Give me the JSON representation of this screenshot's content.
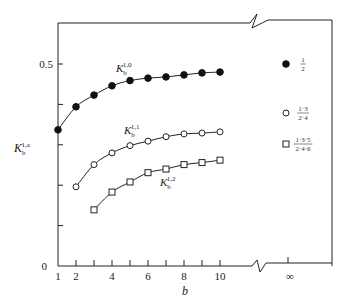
{
  "chart_data": {
    "type": "line",
    "title": "",
    "xlabel": "b",
    "ylabel": "K_b^{1,a}",
    "x": [
      1,
      2,
      3,
      4,
      5,
      6,
      7,
      8,
      9,
      10
    ],
    "x_ticks": [
      1,
      2,
      3,
      4,
      5,
      6,
      7,
      8,
      9,
      10
    ],
    "x_tick_labels": [
      "1",
      "2",
      "4",
      "6",
      "8",
      "10",
      "∞"
    ],
    "y_ticks": [
      0,
      0.1,
      0.2,
      0.3,
      0.4,
      0.5
    ],
    "y_tick_labels": [
      "0",
      "0.5"
    ],
    "ylim": [
      0,
      0.6
    ],
    "x_axis_break": true,
    "grid": false,
    "series": [
      {
        "name": "K_b^{1,0}",
        "label_main": "K",
        "label_sub": "b",
        "label_sup": "1,0",
        "marker": "filled-circle",
        "x": [
          1,
          2,
          3,
          4,
          5,
          6,
          7,
          8,
          9,
          10
        ],
        "values": [
          0.337,
          0.394,
          0.423,
          0.446,
          0.459,
          0.465,
          0.468,
          0.473,
          0.478,
          0.48
        ],
        "limit_value": 0.5,
        "limit_label_num": "1",
        "limit_label_den": "2"
      },
      {
        "name": "K_b^{1,1}",
        "label_main": "K",
        "label_sub": "b",
        "label_sup": "1,1",
        "marker": "open-circle",
        "x": [
          2,
          3,
          4,
          5,
          6,
          7,
          8,
          9,
          10
        ],
        "values": [
          0.196,
          0.251,
          0.28,
          0.298,
          0.309,
          0.32,
          0.327,
          0.329,
          0.332
        ],
        "limit_value": 0.375,
        "limit_label_num": "1·3",
        "limit_label_den": "2·4"
      },
      {
        "name": "K_b^{1,2}",
        "label_main": "K",
        "label_sub": "b",
        "label_sup": "1,2",
        "marker": "open-square",
        "x": [
          3,
          4,
          5,
          6,
          7,
          8,
          9,
          10
        ],
        "values": [
          0.139,
          0.183,
          0.208,
          0.231,
          0.24,
          0.251,
          0.256,
          0.262
        ],
        "limit_value": 0.3125,
        "limit_label_num": "1·3·5",
        "limit_label_den": "2·4·6"
      }
    ],
    "legend_position": "right, at x = ∞"
  },
  "axes": {
    "x_label": "b",
    "y_label_main": "K",
    "y_label_sub": "b",
    "y_label_sup": "1,a",
    "y_zero": "0",
    "y_half": "0.5",
    "x_labels": [
      {
        "value": 1,
        "text": "1"
      },
      {
        "value": 2,
        "text": "2"
      },
      {
        "value": 4,
        "text": "4"
      },
      {
        "value": 6,
        "text": "6"
      },
      {
        "value": 8,
        "text": "8"
      },
      {
        "value": 10,
        "text": "10"
      }
    ],
    "x_inf": "∞"
  }
}
